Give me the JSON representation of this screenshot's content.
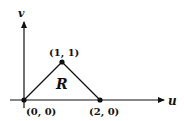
{
  "diagram": {
    "axes": {
      "horizontal_label": "u",
      "vertical_label": "v"
    },
    "region_label": "R",
    "points": [
      {
        "label": "(0, 0)",
        "u": 0,
        "v": 0
      },
      {
        "label": "(1, 1)",
        "u": 1,
        "v": 1
      },
      {
        "label": "(2, 0)",
        "u": 2,
        "v": 0
      }
    ],
    "colors": {
      "ink": "#111111",
      "background": "#ffffff"
    }
  }
}
